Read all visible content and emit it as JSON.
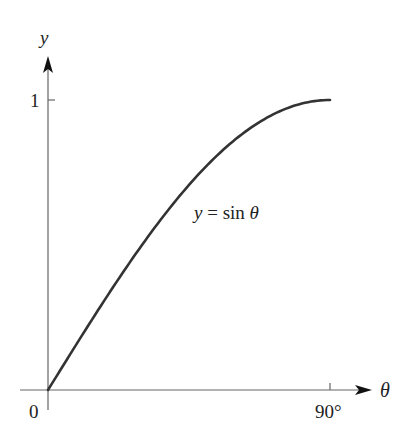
{
  "chart_data": {
    "type": "line",
    "title": "",
    "xlabel": "θ",
    "ylabel": "y",
    "x_tick_labels": [
      "0",
      "90°"
    ],
    "y_tick_labels": [
      "1"
    ],
    "xlim": [
      0,
      90
    ],
    "ylim": [
      0,
      1
    ],
    "grid": false,
    "annotation": "y = sin θ",
    "series": [
      {
        "name": "y = sin θ",
        "x": [
          0,
          10,
          20,
          30,
          40,
          50,
          60,
          70,
          80,
          90
        ],
        "values": [
          0,
          0.174,
          0.342,
          0.5,
          0.643,
          0.766,
          0.866,
          0.94,
          0.985,
          1
        ]
      }
    ]
  },
  "labels": {
    "y_axis": "y",
    "x_axis": "θ",
    "origin": "0",
    "y_tick": "1",
    "x_tick": "90°",
    "curve_label": "y = sin θ"
  },
  "colors": {
    "axis": "#555555",
    "curve": "#333333",
    "text": "#222222"
  }
}
